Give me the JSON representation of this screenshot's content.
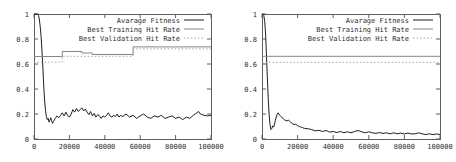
{
  "figure": {
    "background": "#ffffff",
    "frame_color": "#5f5f5f",
    "text_color": "#2e2e2e"
  },
  "chart_data": [
    {
      "type": "line",
      "title": "",
      "xlabel": "",
      "ylabel": "",
      "xlim": [
        0,
        100000
      ],
      "ylim": [
        0,
        1
      ],
      "xticks": [
        0,
        20000,
        40000,
        60000,
        80000,
        100000
      ],
      "yticks": [
        0,
        0.2,
        0.4,
        0.6,
        0.8,
        1
      ],
      "xtick_labels": [
        "0",
        "20000",
        "40000",
        "60000",
        "80000",
        "100000"
      ],
      "ytick_labels": [
        "0",
        "0.2",
        "0.4",
        "0.6",
        "0.8",
        "1"
      ],
      "grid": false,
      "legend_position": "top-right-inside",
      "series": [
        {
          "name": "Avarage Fitness",
          "line_style": "solid",
          "color": "#1f1f1f",
          "x": [
            0,
            1000,
            2000,
            2500,
            3000,
            3500,
            4000,
            4500,
            5000,
            5500,
            6000,
            6500,
            7000,
            7500,
            8000,
            8500,
            9000,
            9500,
            10000,
            10500,
            11000,
            12000,
            13000,
            14000,
            15000,
            16000,
            17000,
            18000,
            19000,
            20000,
            21000,
            22000,
            23000,
            24000,
            25000,
            26000,
            27000,
            28000,
            29000,
            30000,
            31000,
            32000,
            33000,
            34000,
            35000,
            36000,
            37000,
            38000,
            39000,
            40000,
            41000,
            42000,
            43000,
            44000,
            45000,
            46000,
            47000,
            48000,
            49000,
            50000,
            52000,
            54000,
            56000,
            58000,
            60000,
            62000,
            64000,
            66000,
            68000,
            70000,
            72000,
            74000,
            76000,
            78000,
            80000,
            82000,
            84000,
            86000,
            88000,
            90000,
            92000,
            93000,
            94000,
            96000,
            98000,
            100000
          ],
          "y": [
            1.0,
            1.0,
            1.0,
            0.99,
            0.96,
            0.9,
            0.82,
            0.7,
            0.57,
            0.43,
            0.31,
            0.23,
            0.18,
            0.155,
            0.165,
            0.135,
            0.15,
            0.17,
            0.145,
            0.125,
            0.14,
            0.165,
            0.185,
            0.17,
            0.19,
            0.21,
            0.185,
            0.215,
            0.19,
            0.175,
            0.2,
            0.235,
            0.215,
            0.245,
            0.22,
            0.235,
            0.25,
            0.225,
            0.24,
            0.215,
            0.195,
            0.22,
            0.185,
            0.205,
            0.175,
            0.195,
            0.185,
            0.165,
            0.185,
            0.175,
            0.19,
            0.21,
            0.185,
            0.175,
            0.19,
            0.18,
            0.2,
            0.175,
            0.19,
            0.18,
            0.2,
            0.175,
            0.19,
            0.165,
            0.185,
            0.2,
            0.175,
            0.165,
            0.185,
            0.175,
            0.19,
            0.165,
            0.175,
            0.185,
            0.165,
            0.175,
            0.155,
            0.175,
            0.165,
            0.19,
            0.21,
            0.22,
            0.2,
            0.19,
            0.185,
            0.19
          ]
        },
        {
          "name": "Best Training Hit Rate",
          "line_style": "solid",
          "color": "#868686",
          "x": [
            0,
            16000,
            16000,
            27000,
            27000,
            33000,
            33000,
            56000,
            56000,
            100000
          ],
          "y": [
            0.66,
            0.66,
            0.7,
            0.7,
            0.688,
            0.688,
            0.676,
            0.676,
            0.737,
            0.737
          ]
        },
        {
          "name": "Best Validation Hit Rate",
          "line_style": "dotted",
          "color": "#a8a8a8",
          "x": [
            0,
            16000,
            16000,
            56000,
            56000,
            100000
          ],
          "y": [
            0.615,
            0.615,
            0.662,
            0.662,
            0.722,
            0.722
          ]
        }
      ]
    },
    {
      "type": "line",
      "title": "",
      "xlabel": "",
      "ylabel": "",
      "xlim": [
        0,
        100000
      ],
      "ylim": [
        0,
        1
      ],
      "xticks": [
        0,
        20000,
        40000,
        60000,
        80000,
        100000
      ],
      "yticks": [
        0,
        0.2,
        0.4,
        0.6,
        0.8,
        1
      ],
      "xtick_labels": [
        "0",
        "20000",
        "40000",
        "60000",
        "80000",
        "100000"
      ],
      "ytick_labels": [
        "0",
        "0.2",
        "0.4",
        "0.6",
        "0.8",
        "1"
      ],
      "grid": false,
      "legend_position": "top-right-inside",
      "series": [
        {
          "name": "Avarage Fitness",
          "line_style": "solid",
          "color": "#1f1f1f",
          "x": [
            0,
            500,
            1000,
            1500,
            2000,
            2500,
            3000,
            3500,
            4000,
            4500,
            5000,
            5500,
            6000,
            6500,
            7000,
            7500,
            8000,
            8500,
            9000,
            9500,
            10000,
            11000,
            12000,
            13000,
            14000,
            15000,
            16000,
            17000,
            18000,
            19000,
            20000,
            21000,
            22000,
            23000,
            24000,
            26000,
            28000,
            30000,
            32000,
            34000,
            36000,
            38000,
            40000,
            42000,
            44000,
            46000,
            48000,
            50000,
            52000,
            54000,
            56000,
            58000,
            60000,
            62000,
            64000,
            66000,
            68000,
            70000,
            72000,
            74000,
            76000,
            78000,
            80000,
            82000,
            84000,
            86000,
            88000,
            90000,
            92000,
            94000,
            96000,
            98000,
            100000
          ],
          "y": [
            1.0,
            1.0,
            0.99,
            0.94,
            0.84,
            0.68,
            0.5,
            0.33,
            0.2,
            0.115,
            0.075,
            0.085,
            0.105,
            0.095,
            0.12,
            0.15,
            0.175,
            0.195,
            0.21,
            0.2,
            0.19,
            0.175,
            0.16,
            0.15,
            0.145,
            0.15,
            0.135,
            0.125,
            0.115,
            0.12,
            0.105,
            0.1,
            0.095,
            0.09,
            0.085,
            0.082,
            0.075,
            0.065,
            0.07,
            0.06,
            0.068,
            0.055,
            0.06,
            0.052,
            0.06,
            0.05,
            0.058,
            0.05,
            0.06,
            0.068,
            0.058,
            0.05,
            0.058,
            0.05,
            0.045,
            0.052,
            0.045,
            0.05,
            0.042,
            0.05,
            0.042,
            0.048,
            0.04,
            0.048,
            0.04,
            0.042,
            0.05,
            0.042,
            0.035,
            0.042,
            0.035,
            0.04,
            0.037
          ]
        },
        {
          "name": "Best Training Hit Rate",
          "line_style": "solid",
          "color": "#868686",
          "x": [
            0,
            100000
          ],
          "y": [
            0.662,
            0.662
          ]
        },
        {
          "name": "Best Validation Hit Rate",
          "line_style": "dotted",
          "color": "#a8a8a8",
          "x": [
            0,
            100000
          ],
          "y": [
            0.614,
            0.614
          ]
        }
      ]
    }
  ]
}
